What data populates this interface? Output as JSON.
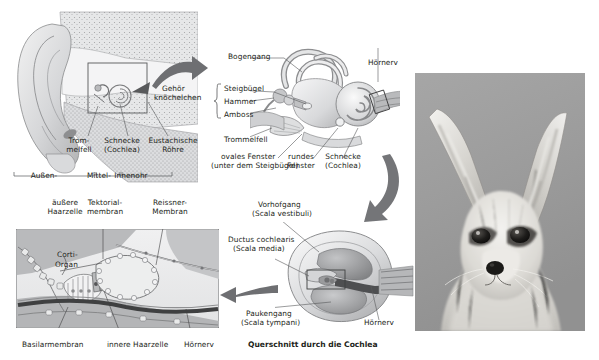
{
  "figure": {
    "language": "de"
  },
  "colors": {
    "ink": "#231f20",
    "leader": "#6d6e71",
    "arrow": "#6e6f72",
    "arrow_dark": "#58595b",
    "panel_border": "#6d6e71",
    "tissue_light": "#e9e9ea",
    "tissue_mid": "#c7c8ca",
    "tissue_dark": "#9a9b9d",
    "nerve": "#3a3a3c",
    "photo_bg": "#9e9e9e",
    "page_bg": "#ffffff"
  },
  "panels": {
    "head_section": {
      "name": "Kopfquerschnitt mit Ohr",
      "labels": [
        {
          "text": "Trom-\nmelfell",
          "x": 71,
          "y": 141
        },
        {
          "text": "Schnecke\n(Cochlea)",
          "x": 114,
          "y": 141
        },
        {
          "text": "Eustachische\nRöhre",
          "x": 157,
          "y": 141
        },
        {
          "text": "Außen-",
          "x": 34,
          "y": 176
        },
        {
          "text": "Mittel-",
          "x": 93,
          "y": 176
        },
        {
          "text": "Innenohr",
          "x": 119,
          "y": 176
        }
      ],
      "callout_box": {
        "x": 88,
        "y": 63,
        "w": 59,
        "h": 50
      }
    },
    "inner_ear": {
      "name": "Mittel- und Innenohr",
      "labels": [
        {
          "text": "Gehör",
          "x": 163,
          "y": 88
        },
        {
          "text": "knöchelchen",
          "x": 155,
          "y": 96
        },
        {
          "text": "Bogengang",
          "x": 228,
          "y": 56
        },
        {
          "text": "Steigbügel",
          "x": 222,
          "y": 88
        },
        {
          "text": "Hammer",
          "x": 222,
          "y": 101
        },
        {
          "text": "Amboss",
          "x": 222,
          "y": 114
        },
        {
          "text": "Trommelfell",
          "x": 222,
          "y": 139
        },
        {
          "text": "Hörnerv",
          "x": 369,
          "y": 62
        },
        {
          "text": "ovales Fenster",
          "x": 222,
          "y": 156
        },
        {
          "text": "(unter dem Steigbügel)",
          "x": 212,
          "y": 165
        },
        {
          "text": "rundes",
          "x": 291,
          "y": 156
        },
        {
          "text": "Fenster",
          "x": 290,
          "y": 165
        },
        {
          "text": "Schnecke",
          "x": 325,
          "y": 156
        },
        {
          "text": "(Cochlea)",
          "x": 325,
          "y": 165
        }
      ]
    },
    "cochlea_cross_section": {
      "name": "Querschnitt durch die Cochlea",
      "labels": [
        {
          "text": "Vorhofgang",
          "x": 259,
          "y": 204
        },
        {
          "text": "(Scala vestibuli)",
          "x": 253,
          "y": 213
        },
        {
          "text": "Ductus cochlearis",
          "x": 230,
          "y": 239
        },
        {
          "text": "(Scala media)",
          "x": 235,
          "y": 248
        },
        {
          "text": "Paukengang",
          "x": 247,
          "y": 313
        },
        {
          "text": "(Scala tympani)",
          "x": 242,
          "y": 322
        },
        {
          "text": "Hörnerv",
          "x": 365,
          "y": 322
        }
      ],
      "caption": "Querschnitt durch die Cochlea",
      "caption_x": 272,
      "caption_y": 343,
      "detail_box": {
        "x": 307,
        "y": 265,
        "w": 38,
        "h": 19
      }
    },
    "organ_of_corti": {
      "name": "Corti-Organ Detailansicht",
      "frame": {
        "x": 16,
        "y": 229,
        "w": 203,
        "h": 99
      },
      "labels": [
        {
          "text": "äußere",
          "x": 55,
          "y": 202
        },
        {
          "text": "Haarzelle",
          "x": 49,
          "y": 211
        },
        {
          "text": "Tektorial-",
          "x": 103,
          "y": 202
        },
        {
          "text": "membran",
          "x": 103,
          "y": 211
        },
        {
          "text": "Reissner-",
          "x": 166,
          "y": 202
        },
        {
          "text": "Membran",
          "x": 166,
          "y": 211
        },
        {
          "text": "Corti-",
          "x": 58,
          "y": 254
        },
        {
          "text": "Organ",
          "x": 56,
          "y": 264
        },
        {
          "text": "Basilarmembran",
          "x": 24,
          "y": 344
        },
        {
          "text": "innere Haarzelle",
          "x": 109,
          "y": 344
        },
        {
          "text": "Hörnerv",
          "x": 186,
          "y": 344
        }
      ]
    },
    "fennec_photo": {
      "name": "Fennek (Wüstenfuchs) Fotografie",
      "x": 415,
      "y": 73,
      "w": 170,
      "h": 258,
      "alt": "Fennek mit großen Ohren, Schwarzweißfoto"
    }
  },
  "arrows": [
    {
      "name": "arrow-head-to-innerear",
      "from": "head_section",
      "to": "inner_ear"
    },
    {
      "name": "arrow-innerear-to-crosssection",
      "from": "inner_ear",
      "to": "cochlea_cross_section"
    },
    {
      "name": "arrow-crosssection-to-corti",
      "from": "cochlea_cross_section",
      "to": "organ_of_corti"
    }
  ]
}
